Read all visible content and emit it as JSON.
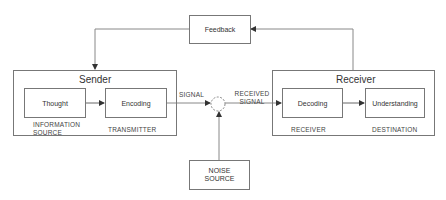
{
  "diagram": {
    "type": "communication-model",
    "feedback": {
      "label": "Feedback"
    },
    "sender": {
      "title": "Sender",
      "nodes": [
        {
          "label": "Thought",
          "caption": "INFORMATION SOURCE"
        },
        {
          "label": "Encoding",
          "caption": "TRANSMITTER"
        }
      ]
    },
    "channel": {
      "signal_label": "SIGNAL",
      "received_label": "RECEIVED SIGNAL",
      "noise": {
        "label": "NOISE SOURCE"
      }
    },
    "receiver": {
      "title": "Receiver",
      "nodes": [
        {
          "label": "Decoding",
          "caption": "RECEIVER"
        },
        {
          "label": "Understanding",
          "caption": "DESTINATION"
        }
      ]
    },
    "colors": {
      "line": "#777777",
      "text": "#333333",
      "background": "#ffffff"
    }
  }
}
